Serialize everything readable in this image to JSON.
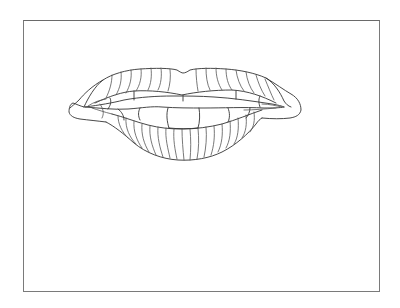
{
  "illustration": {
    "subject": "lips-line-drawing",
    "description": "Outline drawing of open lips showing upper and lower lip ridges and front teeth",
    "colors": {
      "background": "#ffffff",
      "frame_border": "#7a7a7a",
      "line": "#333333"
    },
    "frame": {
      "x": 23,
      "y": 20,
      "width": 355,
      "height": 270
    }
  }
}
